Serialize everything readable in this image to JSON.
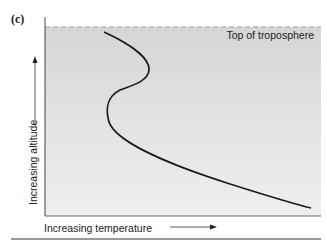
{
  "figure": {
    "panel_label": "(c)",
    "boundary_label": "Top of troposphere",
    "x_axis_label": "Increasing temperature",
    "y_axis_label": "Increasing altitude",
    "colors": {
      "plot_background": "#dcdcdc",
      "curve": "#1a1a1a",
      "axis": "#333333",
      "dashed_line": "#999999",
      "bottom_rule": "#777777"
    },
    "curve_description": "Temperature profile: decreases with altitude from lower right, reverses (inversion) near mid-altitude, then bulges toward warmer before cooling to top of troposphere"
  }
}
